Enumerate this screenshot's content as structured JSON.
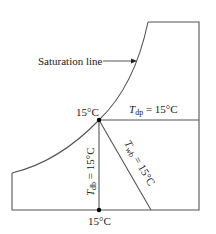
{
  "diagram": {
    "saturation_label": "Saturation line",
    "point_label_top": "15°C",
    "point_label_bottom": "15°C",
    "dew_point": {
      "symbol": "T",
      "subscript": "dp",
      "value": " = 15°C"
    },
    "dry_bulb": {
      "symbol": "T",
      "subscript": "db",
      "value": " = 15°C"
    },
    "wet_bulb": {
      "symbol": "T",
      "subscript": "wb",
      "value": " = 15°C"
    },
    "colors": {
      "line": "#4a4a4a",
      "text": "#1a1a1a",
      "point": "#000000"
    }
  }
}
